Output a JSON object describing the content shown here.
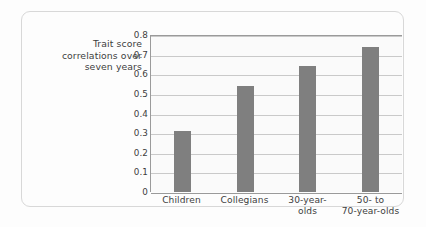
{
  "chart_data": {
    "type": "bar",
    "title": "",
    "xlabel": "",
    "ylabel": "Trait score correlations over seven years",
    "ylabel_lines": [
      "Trait score",
      "correlations over",
      "seven years"
    ],
    "categories": [
      "Children",
      "Collegians",
      "30-year-olds",
      "50- to 70-year-olds"
    ],
    "category_lines": [
      [
        "Children"
      ],
      [
        "Collegians"
      ],
      [
        "30-year-",
        "olds"
      ],
      [
        "50- to",
        "70-year-olds"
      ]
    ],
    "values": [
      0.31,
      0.54,
      0.64,
      0.74
    ],
    "ylim": [
      0,
      0.8
    ],
    "yticks": [
      "0.8",
      "0.7",
      "0.6",
      "0.5",
      "0.4",
      "0.3",
      "0.2",
      "0.1",
      "0"
    ],
    "ytick_values": [
      0.8,
      0.7,
      0.6,
      0.5,
      0.4,
      0.3,
      0.2,
      0.1,
      0
    ],
    "grid": true,
    "legend": "none",
    "bar_color": "#7f7f7f",
    "gridline_color": "#c9c9c9",
    "axis_color": "#9a9a9a",
    "text_color": "#3d3d3d",
    "background_color": "#fdfdfd",
    "plot_background_color": "#fafafa"
  }
}
